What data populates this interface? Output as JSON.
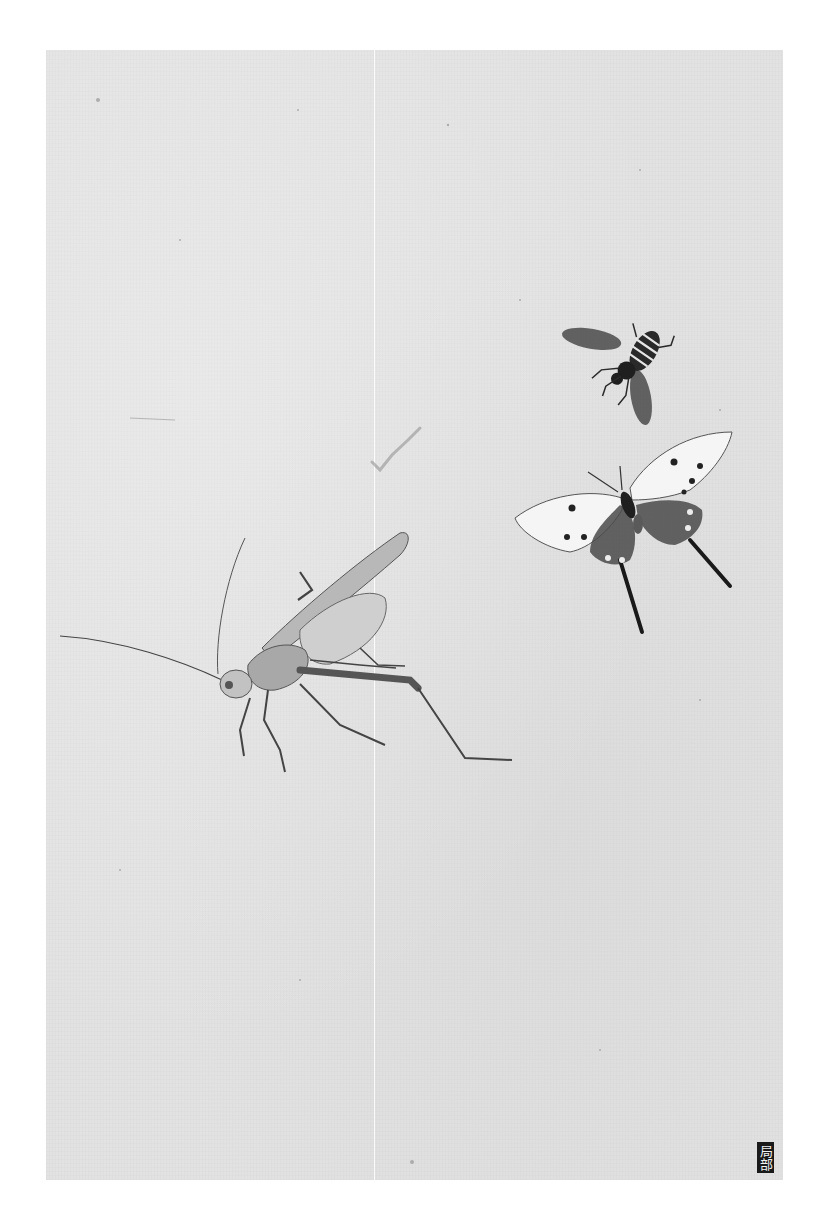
{
  "artwork": {
    "subject": [
      "grasshopper",
      "bee",
      "butterfly"
    ],
    "medium_tone": "ink on paper, grayscale",
    "paper_color": "#e2e2e2",
    "ink_color": "#2a2a2a"
  },
  "label": {
    "text": "局部",
    "background": "#1a1a1a",
    "color": "#f2f2f2"
  }
}
